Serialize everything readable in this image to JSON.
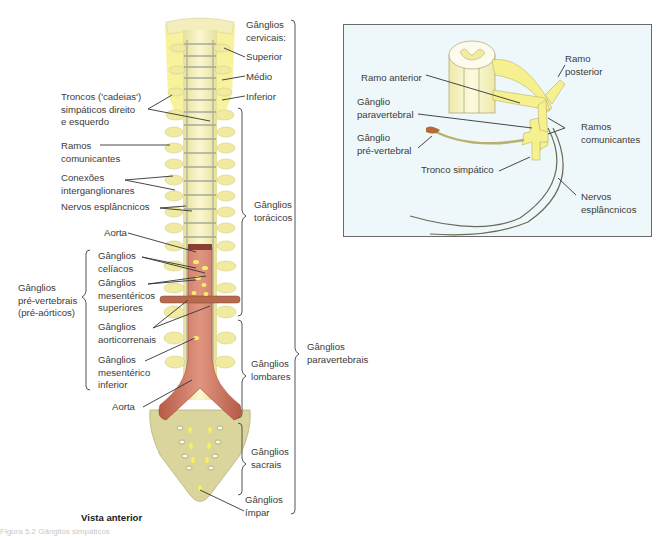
{
  "main_figure": {
    "view_label": "Vista anterior",
    "labels": {
      "cervical_header": [
        "Gânglios",
        "cervicais:"
      ],
      "superior": "Superior",
      "medio": "Médio",
      "inferior": "Inferior",
      "troncos": [
        "Troncos ('cadeias')",
        "simpáticos direito",
        "e esquerdo"
      ],
      "ramos_comunicantes": [
        "Ramos",
        "comunicantes"
      ],
      "conexoes": [
        "Conexões",
        "interganglionares"
      ],
      "nervos_esplancnicos": "Nervos esplâncnicos",
      "aorta_top": "Aorta",
      "celiacos": [
        "Gânglios",
        "celíacos"
      ],
      "mesentericos_superiores": [
        "Gânglios",
        "mesentéricos",
        "superiores"
      ],
      "aorticorrenais": [
        "Gânglios",
        "aorticorrenais"
      ],
      "mesenterico_inferior": [
        "Gânglios",
        "mesentérico",
        "inferior"
      ],
      "aorta_bottom": "Aorta",
      "pre_vertebrais": [
        "Gânglios",
        "pré-vertebrais",
        "(pré-aórticos)"
      ],
      "toracicos": [
        "Gânglios",
        "torácicos"
      ],
      "lombares": [
        "Gânglios",
        "lombares"
      ],
      "sacrais": [
        "Gânglios",
        "sacrais"
      ],
      "impar": [
        "Gânglios",
        "ímpar"
      ],
      "paravertebrais": [
        "Gânglios",
        "paravertebrais"
      ]
    }
  },
  "inset_figure": {
    "labels": {
      "ramo_anterior": "Ramo anterior",
      "ramo_posterior": [
        "Ramo",
        "posterior"
      ],
      "ganglio_paravertebral": [
        "Gânglio",
        "paravertebral"
      ],
      "ganglio_pre_vertebral": [
        "Gânglio",
        "pré-vertebral"
      ],
      "ramos_comunicantes": [
        "Ramos",
        "comunicantes"
      ],
      "tronco_simpatico": "Tronco simpático",
      "nervos_esplancnicos": [
        "Nervos",
        "esplâncnicos"
      ]
    }
  },
  "caption": "Figura 5.2 Gânglios simpáticos",
  "colors": {
    "bone": "#f3eeb8",
    "nerve_yellow": "#f7f08a",
    "aorta": "#c9705b",
    "sacrum": "#d8d49a",
    "inset_bg": "#eef8fb",
    "leader": "#333333",
    "bracket": "#555555"
  }
}
